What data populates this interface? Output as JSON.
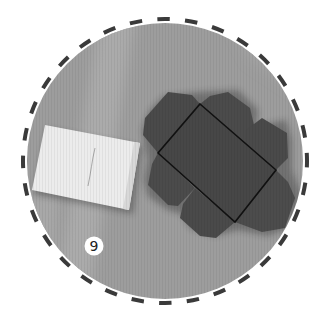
{
  "illustration": {
    "subject": "unfolded box net next to a white note card on cardboard",
    "step_number": "9",
    "colors": {
      "background": "#ffffff",
      "cardboard": "#9d9d9d",
      "cardboard_light": "#b2b2b2",
      "dash_ring": "#3a3a3a",
      "box_net": "#4a4a4a",
      "box_fold_line": "#111111",
      "note_card": "#ececec",
      "badge_fill": "#ffffff",
      "badge_text": "#222222"
    }
  }
}
